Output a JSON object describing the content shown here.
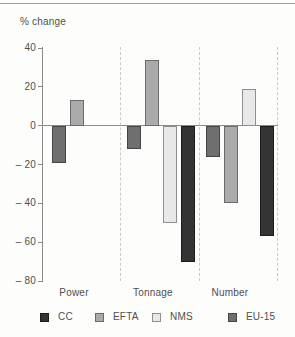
{
  "chart_data": {
    "type": "bar",
    "title": "% change",
    "categories": [
      "Power",
      "Tonnage",
      "Number"
    ],
    "series": [
      {
        "name": "EU-15",
        "values": [
          -19,
          -12,
          -16
        ],
        "fill": "#6f6f6f",
        "border": "#454545"
      },
      {
        "name": "EFTA",
        "values": [
          13,
          34,
          -40
        ],
        "fill": "#ababab",
        "border": "#6b6b6b"
      },
      {
        "name": "NMS",
        "values": [
          null,
          -50,
          19
        ],
        "fill": "#e8e8e8",
        "border": "#8f8f8f"
      },
      {
        "name": "CC",
        "values": [
          null,
          -70,
          -57
        ],
        "fill": "#343434",
        "border": "#1c1c1c"
      }
    ],
    "legend": [
      {
        "label": "CC",
        "fill": "#343434",
        "border": "#1c1c1c"
      },
      {
        "label": "EFTA",
        "fill": "#ababab",
        "border": "#6b6b6b"
      },
      {
        "label": "NMS",
        "fill": "#e8e8e8",
        "border": "#8f8f8f"
      },
      {
        "label": "EU-15",
        "fill": "#6f6f6f",
        "border": "#454545"
      }
    ],
    "legend_position": "bottom",
    "y_axis": {
      "min": -80,
      "max": 40,
      "tick_step": 20,
      "tick_labels": [
        "40",
        "20",
        "0",
        "– 20",
        "– 40",
        "– 60",
        "– 80"
      ]
    },
    "grid": {
      "zero_line": true,
      "group_separators": "dashed"
    }
  }
}
